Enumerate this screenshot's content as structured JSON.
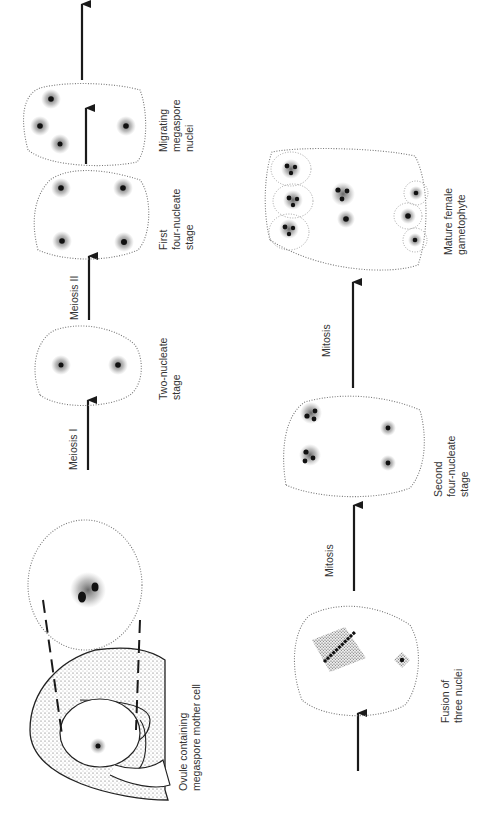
{
  "diagram": {
    "orientation": "rotated 90 degrees counter-clockwise; read bottom to top",
    "top_row": {
      "stages": [
        {
          "id": "ovule",
          "label_lines": [
            "Ovule containing",
            "megaspore mother cell"
          ]
        },
        {
          "id": "magnified-cell",
          "label_lines": []
        },
        {
          "id": "two-nucleate",
          "label_lines": [
            "Two-nucleate",
            "stage"
          ]
        },
        {
          "id": "first-four-nucleate",
          "label_lines": [
            "First",
            "four-nucleate",
            "stage"
          ]
        },
        {
          "id": "migrating",
          "label_lines": [
            "Migrating",
            "megaspore",
            "nuclei"
          ]
        }
      ],
      "arrows": [
        {
          "id": "meiosis-1",
          "label": "Meiosis I"
        },
        {
          "id": "meiosis-2",
          "label": "Meiosis II"
        },
        {
          "id": "to-migrating",
          "label": ""
        },
        {
          "id": "continue",
          "label": ""
        }
      ]
    },
    "bottom_row": {
      "stages": [
        {
          "id": "fusion",
          "label_lines": [
            "Fusion of",
            "three nuclei"
          ]
        },
        {
          "id": "second-four-nucleate",
          "label_lines": [
            "Second",
            "four-nucleate",
            "stage"
          ]
        },
        {
          "id": "mature",
          "label_lines": [
            "Mature female",
            "gametophyte"
          ]
        }
      ],
      "arrows": [
        {
          "id": "entry",
          "label": ""
        },
        {
          "id": "mitosis-1",
          "label": "Mitosis"
        },
        {
          "id": "mitosis-2",
          "label": "Mitosis"
        }
      ]
    }
  }
}
